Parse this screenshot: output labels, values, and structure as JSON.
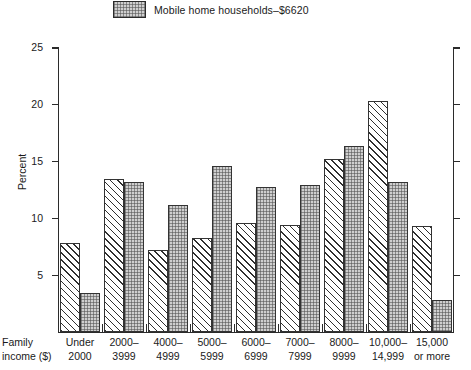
{
  "legend": {
    "swatch_icon": "stipple-swatch",
    "label": "Mobile home households–$6620"
  },
  "axes": {
    "y_title": "Percent",
    "y_ticks": [
      "5",
      "10",
      "15",
      "20",
      "25"
    ],
    "x_title_line1": "Family",
    "x_title_line2": "income ($)"
  },
  "chart_data": {
    "type": "bar",
    "title": "",
    "xlabel": "Family income ($)",
    "ylabel": "Percent",
    "ylim": [
      0,
      25
    ],
    "yticks": [
      5,
      10,
      15,
      20,
      25
    ],
    "grid": false,
    "legend_position": "top",
    "categories": [
      "Under 2000",
      "2000–3999",
      "4000–4999",
      "5000–5999",
      "6000–6999",
      "7000–7999",
      "8000–9999",
      "10,000–14,999",
      "15,000 or more"
    ],
    "category_lines": [
      [
        "Under",
        "2000"
      ],
      [
        "2000–",
        "3999"
      ],
      [
        "4000–",
        "4999"
      ],
      [
        "5000–",
        "5999"
      ],
      [
        "6000–",
        "6999"
      ],
      [
        "7000–",
        "7999"
      ],
      [
        "8000–",
        "9999"
      ],
      [
        "10,000–",
        "14,999"
      ],
      [
        "15,000",
        "or more"
      ]
    ],
    "series": [
      {
        "name": "All households",
        "pattern": "diagonal-hatch",
        "values": [
          7.8,
          13.5,
          7.2,
          8.3,
          9.6,
          9.4,
          15.2,
          20.3,
          9.3
        ]
      },
      {
        "name": "Mobile home households–$6620",
        "pattern": "stipple",
        "values": [
          3.4,
          13.2,
          11.2,
          14.65,
          12.8,
          12.9,
          16.4,
          13.2,
          2.8
        ]
      }
    ]
  },
  "colors": {
    "axis": "#2b2b2b",
    "hatch": "#2f2f2f",
    "stipple_fill": "#cfcfcf",
    "background": "#ffffff"
  }
}
